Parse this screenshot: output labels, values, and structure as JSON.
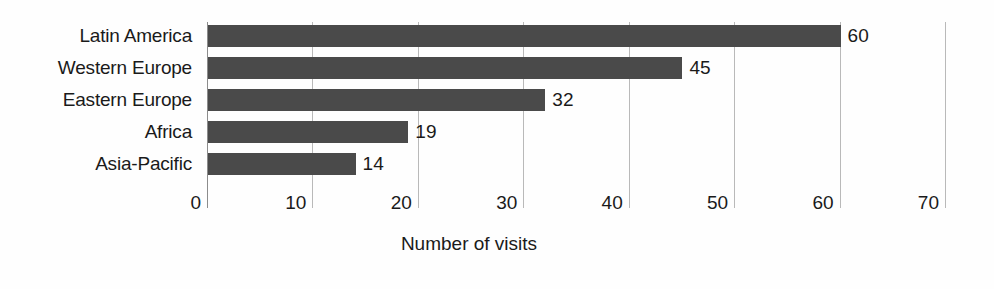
{
  "chart_data": {
    "type": "bar",
    "orientation": "horizontal",
    "title": "",
    "xlabel": "Number of visits",
    "ylabel": "",
    "categories": [
      "Latin America",
      "Western Europe",
      "Eastern Europe",
      "Africa",
      "Asia-Pacific"
    ],
    "values": [
      60,
      45,
      32,
      19,
      14
    ],
    "value_labels": [
      "60",
      "45",
      "32",
      "19",
      "14"
    ],
    "xlim": [
      0,
      70
    ],
    "xticks": [
      0,
      10,
      20,
      30,
      40,
      50,
      60,
      70
    ],
    "xtick_labels": [
      "0",
      "10",
      "20",
      "30",
      "40",
      "50",
      "60",
      "70"
    ],
    "grid": "vertical",
    "legend": "none",
    "bar_color": "#4a4a4a",
    "gridline_color": "#b9b9b9",
    "axis_color": "#8c8c8c",
    "background_color": "#fefefe"
  }
}
